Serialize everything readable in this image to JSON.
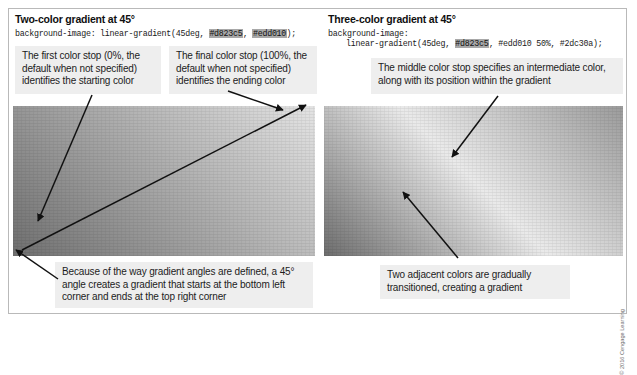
{
  "figure": {
    "border_color": "#b9b9b9",
    "background": "#ffffff"
  },
  "copyright": "© 2016 Cengage Learning",
  "panels": [
    {
      "id": "two-color",
      "heading": "Two-color gradient at 45°",
      "code": {
        "property": "background-image: linear-gradient(45deg, ",
        "color_1": "#d823c5",
        "separator_1": ", ",
        "color_2": "#edd010",
        "terminator": ");"
      },
      "callouts": [
        {
          "id": "first-color-stop",
          "text": "The first color stop (0%, the default when not specified) identifies the starting color"
        },
        {
          "id": "final-color-stop",
          "text": "The final color stop (100%, the default when not specified) identifies the ending color"
        },
        {
          "id": "angle-explanation",
          "text": "Because of the way gradient angles are defined, a 45° angle creates a gradient that starts at the bottom left corner and ends at the top right corner"
        }
      ],
      "gradient_preview": {
        "label": "two-color-gradient-preview",
        "angle": "45deg",
        "stops": [
          "#d823c5",
          "#edd010"
        ],
        "print_rendering": "grayscale"
      }
    },
    {
      "id": "three-color",
      "heading": "Three-color gradient at 45°",
      "code": {
        "property": "background-image:",
        "indent": "linear-gradient(45deg, ",
        "color_1": "#d823c5",
        "separator_1": ", ",
        "color_2": "#edd010 50%",
        "separator_2": ", ",
        "color_3": "#2dc30a",
        "terminator": ");"
      },
      "callouts": [
        {
          "id": "middle-color-stop",
          "text": "The middle color stop specifies an intermediate color, along with its position within the gradient"
        },
        {
          "id": "adjacent-colors",
          "text": "Two adjacent colors are gradually transitioned, creating a gradient"
        }
      ],
      "gradient_preview": {
        "label": "three-color-gradient-preview",
        "angle": "45deg",
        "stops": [
          "#d823c5",
          "#edd010 50%",
          "#2dc30a"
        ],
        "print_rendering": "grayscale"
      }
    }
  ]
}
